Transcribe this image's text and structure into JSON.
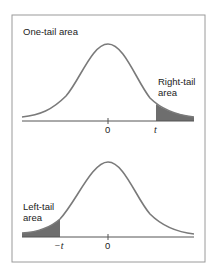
{
  "top_panel": {
    "title": "One-tail area",
    "tail_label_line1": "Right-tail",
    "tail_label_line2": "area",
    "tick_zero": "0",
    "tick_t": "t"
  },
  "bottom_panel": {
    "tail_label_line1": "Left-tail",
    "tail_label_line2": "area",
    "tick_zero": "0",
    "tick_neg_t": "−t"
  },
  "colors": {
    "frame": "#9a9a9a",
    "curve": "#7a7a7a",
    "shade": "#6e6e6e",
    "axis": "#555555"
  }
}
